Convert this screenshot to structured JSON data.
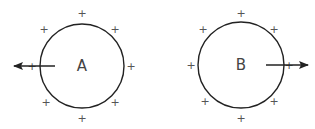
{
  "diagram": {
    "circles": [
      {
        "label": "A",
        "cx": 82,
        "cy": 66,
        "r": 42,
        "arrow": {
          "x1": 55,
          "y1": 66,
          "x2": 14,
          "y2": 66,
          "direction": "left"
        },
        "charges": [
          {
            "x": 82,
            "y": 13,
            "sign": "+"
          },
          {
            "x": 44,
            "y": 29,
            "sign": "+"
          },
          {
            "x": 115,
            "y": 29,
            "sign": "+"
          },
          {
            "x": 32,
            "y": 66,
            "sign": "+"
          },
          {
            "x": 131,
            "y": 66,
            "sign": "+"
          },
          {
            "x": 46,
            "y": 102,
            "sign": "+"
          },
          {
            "x": 115,
            "y": 102,
            "sign": "+"
          },
          {
            "x": 82,
            "y": 118,
            "sign": "+"
          }
        ]
      },
      {
        "label": "B",
        "cx": 241,
        "cy": 65,
        "r": 43,
        "arrow": {
          "x1": 266,
          "y1": 65,
          "x2": 308,
          "y2": 65,
          "direction": "right"
        },
        "charges": [
          {
            "x": 241,
            "y": 13,
            "sign": "+"
          },
          {
            "x": 203,
            "y": 29,
            "sign": "+"
          },
          {
            "x": 274,
            "y": 29,
            "sign": "+"
          },
          {
            "x": 191,
            "y": 65,
            "sign": "+"
          },
          {
            "x": 289,
            "y": 65,
            "sign": "+"
          },
          {
            "x": 205,
            "y": 101,
            "sign": "+"
          },
          {
            "x": 274,
            "y": 101,
            "sign": "+"
          },
          {
            "x": 241,
            "y": 118,
            "sign": "+"
          }
        ]
      }
    ],
    "colors": {
      "stroke": "#222222",
      "text": "#444444"
    }
  }
}
